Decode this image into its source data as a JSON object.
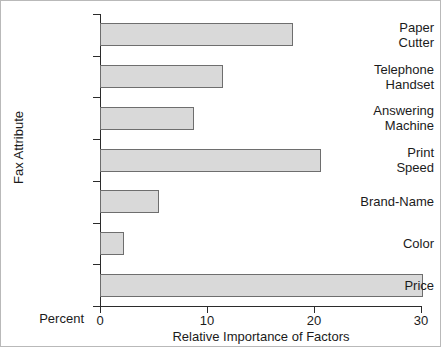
{
  "chart_data": {
    "type": "bar",
    "orientation": "horizontal",
    "title": "",
    "xlabel": "Relative Importance of Factors",
    "ylabel": "Fax Attribute",
    "baseline_label": "Percent",
    "categories": [
      "Paper\nCutter",
      "Telephone\nHandset",
      "Answering\nMachine",
      "Print\nSpeed",
      "Brand-Name",
      "Color",
      "Price"
    ],
    "category_lines": [
      [
        "Paper",
        "Cutter"
      ],
      [
        "Telephone",
        "Handset"
      ],
      [
        "Answering",
        "Machine"
      ],
      [
        "Print",
        "Speed"
      ],
      [
        "Brand-Name"
      ],
      [
        "Color"
      ],
      [
        "Price"
      ]
    ],
    "values": [
      18.0,
      11.5,
      8.8,
      20.7,
      5.5,
      2.2,
      30.2
    ],
    "xlim": [
      0,
      30
    ],
    "xticks": [
      0,
      10,
      20,
      30
    ],
    "xtick_labels": [
      "0",
      "10",
      "20",
      "30"
    ],
    "grid": false,
    "legend": null,
    "bar_fill": "#d9d9d9",
    "bar_edge": "#6e6e6e",
    "axis_color": "#2b2b2b",
    "background": "#ffffff"
  }
}
